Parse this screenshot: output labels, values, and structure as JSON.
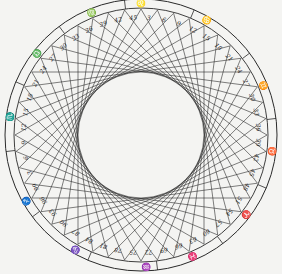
{
  "diagram": {
    "type": "circular zodiac chord diagram",
    "center": [
      141,
      135
    ],
    "outer_radius": 136,
    "band_inner_radius": 127,
    "chord_ring_radius": 126,
    "inner_void_radius": 63,
    "points": 48,
    "chord_step": 16,
    "colors": {
      "ink": "#2a2a2a",
      "paper": "#f4f4f2"
    },
    "zodiac": [
      {
        "glyph": "♏",
        "angle": -82
      },
      {
        "glyph": "♎",
        "angle": -52
      },
      {
        "glyph": "♍",
        "angle": -22
      },
      {
        "glyph": "♌",
        "angle": 0
      },
      {
        "glyph": "♋",
        "angle": 30
      },
      {
        "glyph": "♊",
        "angle": 68
      },
      {
        "glyph": "♉",
        "angle": 97
      },
      {
        "glyph": "♈",
        "angle": 127
      },
      {
        "glyph": "♓",
        "angle": 157
      },
      {
        "glyph": "♒",
        "angle": 178
      },
      {
        "glyph": "♑",
        "angle": 210
      },
      {
        "glyph": "♐",
        "angle": 240
      }
    ],
    "numbers": [
      "3",
      "6",
      "9",
      "12",
      "15",
      "18",
      "21",
      "24",
      "27",
      "30",
      "33",
      "36",
      "39",
      "42",
      "45",
      "48",
      "51",
      "54",
      "57",
      "60",
      "63",
      "66",
      "69",
      "72",
      "75",
      "78",
      "81",
      "84",
      "87",
      "90",
      "93",
      "96",
      "99",
      "3",
      "6",
      "9",
      "12",
      "15",
      "18",
      "21",
      "24",
      "27",
      "30",
      "33",
      "36",
      "39",
      "42",
      "45"
    ]
  }
}
